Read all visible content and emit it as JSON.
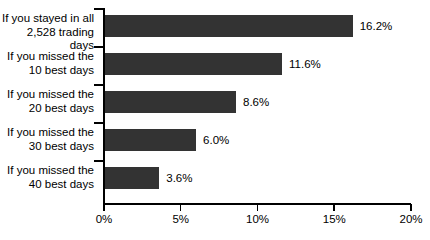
{
  "chart_data": {
    "type": "bar",
    "orientation": "horizontal",
    "title": "",
    "xlabel": "",
    "ylabel": "",
    "xlim": [
      0,
      20
    ],
    "grid": false,
    "legend": null,
    "bar_color": "#333333",
    "axis_color": "#000000",
    "background": "#ffffff",
    "categories": [
      "If you stayed in all\n2,528 trading days",
      "If you missed the\n10 best days",
      "If you missed the\n20 best days",
      "If you missed the\n30 best days",
      "If you missed the\n40 best days"
    ],
    "values": [
      16.2,
      11.6,
      8.6,
      6.0,
      3.6
    ],
    "value_labels": [
      "16.2%",
      "11.6%",
      "8.6%",
      "6.0%",
      "3.6%"
    ],
    "xticks": [
      0,
      5,
      10,
      15,
      20
    ],
    "xtick_labels": [
      "0%",
      "5%",
      "10%",
      "15%",
      "20%"
    ]
  }
}
